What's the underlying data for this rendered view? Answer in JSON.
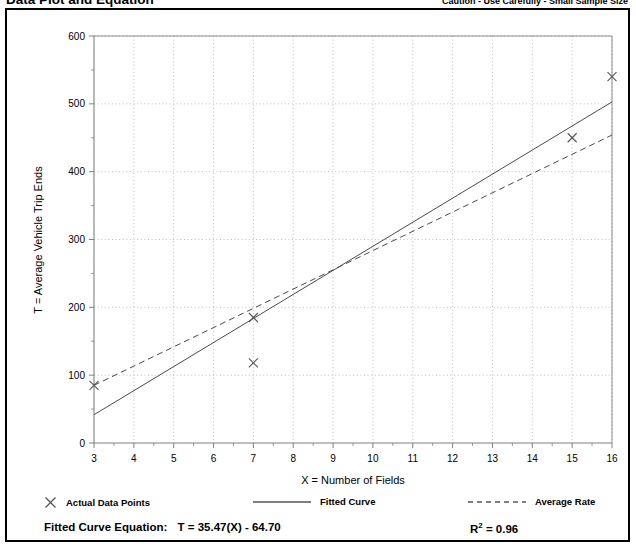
{
  "header": {
    "title": "Data Plot and Equation",
    "caution": "Caution - Use Carefully - Small Sample Size"
  },
  "legend": {
    "points_label": "Actual Data Points",
    "points_marker": "x-marker-icon",
    "fitted_label": "Fitted Curve",
    "fitted_marker": "solid-line-icon",
    "average_label": "Average Rate",
    "average_marker": "dashed-line-icon"
  },
  "equation": {
    "label": "Fitted Curve Equation:",
    "value": "T = 35.47(X) - 64.70",
    "r_label": "R",
    "r_exponent": "2",
    "r_value": "= 0.96"
  },
  "colors": {
    "frame": "#000000",
    "axis": "#808080",
    "grid": "#a0a0a0",
    "data": "#555555",
    "text": "#000000"
  },
  "chart_data": {
    "type": "scatter",
    "title": "Data Plot and Equation",
    "xlabel": "X = Number of Fields",
    "ylabel": "T = Average Vehicle Trip Ends",
    "xlim": [
      3,
      16
    ],
    "ylim": [
      0,
      600
    ],
    "xticks": [
      3,
      4,
      5,
      6,
      7,
      8,
      9,
      10,
      11,
      12,
      13,
      14,
      15,
      16
    ],
    "yticks": [
      0,
      100,
      200,
      300,
      400,
      500,
      600
    ],
    "xtick_labels": [
      "3",
      "4",
      "5",
      "6",
      "7",
      "8",
      "9",
      "10",
      "11",
      "12",
      "13",
      "14",
      "15",
      "16"
    ],
    "ytick_labels": [
      "0",
      "100",
      "200",
      "300",
      "400",
      "500",
      "600"
    ],
    "grid": true,
    "legend_position": "below-plot",
    "points": [
      {
        "x": 3,
        "y": 85
      },
      {
        "x": 7,
        "y": 185
      },
      {
        "x": 7,
        "y": 118
      },
      {
        "x": 15,
        "y": 450
      },
      {
        "x": 16,
        "y": 540
      }
    ],
    "series": [
      {
        "name": "Fitted Curve",
        "type": "line",
        "style": "solid",
        "equation": "T = 35.47(X) - 64.70",
        "r_squared": 0.96,
        "x": [
          3,
          16
        ],
        "values": [
          41.7,
          502.8
        ]
      },
      {
        "name": "Average Rate",
        "type": "line",
        "style": "dashed",
        "x": [
          3,
          16
        ],
        "values": [
          85,
          454
        ]
      }
    ]
  }
}
